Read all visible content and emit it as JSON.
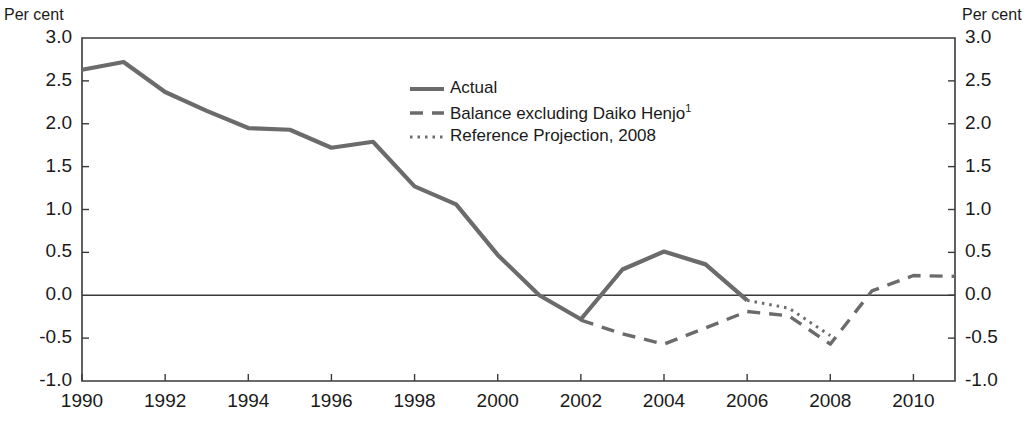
{
  "axis_unit_left": "Per cent",
  "axis_unit_right": "Per cent",
  "legend": {
    "items": [
      {
        "label": "Actual",
        "style": "solid"
      },
      {
        "label": "Balance excluding Daiko Henjo",
        "sup": "1",
        "style": "dashed"
      },
      {
        "label": "Reference Projection, 2008",
        "style": "dotted"
      }
    ]
  },
  "colors": {
    "line": "#6b6b6b",
    "axis": "#3a3a3a",
    "text": "#1a1a1a",
    "background": "#ffffff"
  },
  "chart_data": {
    "type": "line",
    "title": "",
    "xlabel": "",
    "ylabel": "Per cent",
    "xlim": [
      1990,
      2011
    ],
    "ylim": [
      -1.0,
      3.0
    ],
    "grid": false,
    "zero_line": true,
    "legend_position": "top-center",
    "yticks": [
      "3.0",
      "2.5",
      "2.0",
      "1.5",
      "1.0",
      "0.5",
      "0.0",
      "-0.5",
      "-1.0"
    ],
    "ytick_values": [
      3.0,
      2.5,
      2.0,
      1.5,
      1.0,
      0.5,
      0.0,
      -0.5,
      -1.0
    ],
    "xticks": [
      "1990",
      "1992",
      "1994",
      "1996",
      "1998",
      "2000",
      "2002",
      "2004",
      "2006",
      "2008",
      "2010"
    ],
    "xtick_values": [
      1990,
      1992,
      1994,
      1996,
      1998,
      2000,
      2002,
      2004,
      2006,
      2008,
      2010
    ],
    "series": [
      {
        "name": "Actual",
        "style": "solid",
        "x": [
          1990,
          1991,
          1992,
          1993,
          1994,
          1995,
          1996,
          1997,
          1998,
          1999,
          2000,
          2001,
          2002,
          2003,
          2004,
          2005,
          2006
        ],
        "values": [
          2.63,
          2.72,
          2.37,
          2.15,
          1.95,
          1.93,
          1.72,
          1.79,
          1.27,
          1.06,
          0.47,
          0.0,
          -0.28,
          0.3,
          0.51,
          0.36,
          -0.06
        ]
      },
      {
        "name": "Balance excluding Daiko Henjo",
        "style": "dashed",
        "x": [
          2002,
          2003,
          2004,
          2005,
          2006,
          2007,
          2008,
          2009,
          2010,
          2011
        ],
        "values": [
          -0.29,
          -0.45,
          -0.57,
          -0.38,
          -0.19,
          -0.24,
          -0.57,
          0.05,
          0.23,
          0.22
        ]
      },
      {
        "name": "Reference Projection, 2008",
        "style": "dotted",
        "x": [
          2006,
          2007,
          2008
        ],
        "values": [
          -0.06,
          -0.15,
          -0.47
        ]
      }
    ]
  }
}
